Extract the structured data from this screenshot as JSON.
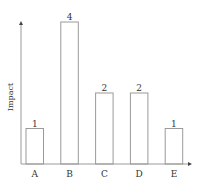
{
  "chart_data": {
    "type": "bar",
    "title": "",
    "xlabel": "",
    "ylabel": "Impact",
    "categories": [
      "A",
      "B",
      "C",
      "D",
      "E"
    ],
    "values": [
      1,
      4,
      2,
      2,
      1
    ],
    "data_labels": [
      "1",
      "4",
      "2",
      "2",
      "1"
    ],
    "ylim": [
      0,
      4
    ],
    "grid": false,
    "legend": null,
    "bar_fill": "#ffffff",
    "bar_stroke": "#9a9a9a",
    "axis_color": "#9a9a9a"
  }
}
